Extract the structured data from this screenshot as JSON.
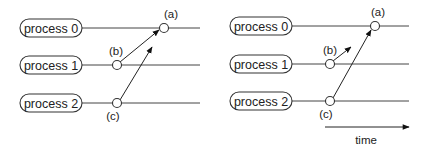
{
  "diagram": {
    "panels": [
      {
        "id": "left",
        "processes": [
          {
            "label": "process 0"
          },
          {
            "label": "process 1"
          },
          {
            "label": "process 2"
          }
        ],
        "events": [
          {
            "label": "(a)",
            "process": 0
          },
          {
            "label": "(b)",
            "process": 1
          },
          {
            "label": "(c)",
            "process": 2
          }
        ],
        "messages": [
          {
            "from": "(b)",
            "to": "(a)",
            "delivered": true
          },
          {
            "from": "(c)",
            "to": "(a)",
            "delivered": false
          }
        ]
      },
      {
        "id": "right",
        "processes": [
          {
            "label": "process 0"
          },
          {
            "label": "process 1"
          },
          {
            "label": "process 2"
          }
        ],
        "events": [
          {
            "label": "(a)",
            "process": 0
          },
          {
            "label": "(b)",
            "process": 1
          },
          {
            "label": "(c)",
            "process": 2
          }
        ],
        "messages": [
          {
            "from": "(b)",
            "to": null,
            "delivered": false
          },
          {
            "from": "(c)",
            "to": "(a)",
            "delivered": true
          }
        ]
      }
    ],
    "time_axis": {
      "label": "time"
    },
    "colors": {
      "stroke": "#333333",
      "background": "#ffffff"
    }
  }
}
